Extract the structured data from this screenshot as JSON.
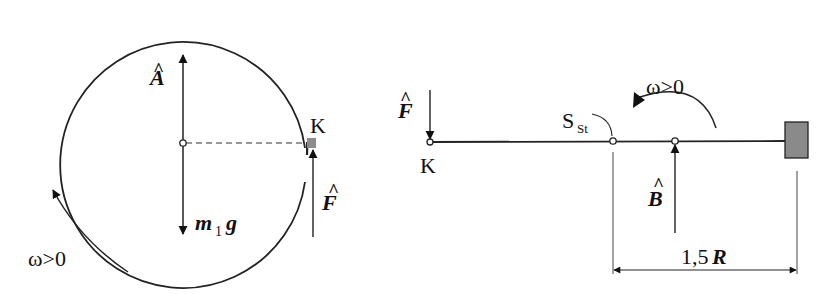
{
  "figure": {
    "left_panel": {
      "description": "Disc (circle) with center support, force vectors",
      "labels": {
        "bearing_force": "A",
        "bearing_force_hat": "^",
        "weight_m": "m",
        "weight_sub": "1",
        "weight_g": "g",
        "point_k": "K",
        "force_f": "F",
        "force_f_hat": "^",
        "omega": "ω>0"
      }
    },
    "right_panel": {
      "description": "Side view: rod from point K to fixed block, with center of mass and bearing",
      "labels": {
        "force_f": "F",
        "force_f_hat": "^",
        "point_k": "K",
        "center_of_mass": "S",
        "center_of_mass_sub": "St",
        "omega": "ω>0",
        "bearing_force": "B",
        "bearing_force_hat": "^",
        "dimension": "1,5",
        "dimension_unit": "R"
      }
    },
    "colors": {
      "line": "#222222",
      "block_fill": "#8a8a8a",
      "mass_fill": "#8c8c8c",
      "background": "#ffffff"
    }
  }
}
